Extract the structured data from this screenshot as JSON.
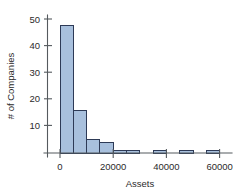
{
  "chart_data": {
    "type": "bar",
    "title": "",
    "subtitle": "",
    "xlabel": "Assets",
    "ylabel": "# of Companies",
    "xlim": [
      -3000,
      67000
    ],
    "ylim": [
      0,
      52
    ],
    "xticks": [
      0,
      20000,
      40000,
      60000
    ],
    "xtick_labels": [
      "0",
      "20000",
      "40000",
      "60000"
    ],
    "yticks": [
      10,
      20,
      30,
      40,
      50
    ],
    "ytick_labels": [
      "10",
      "20",
      "30",
      "40",
      "50"
    ],
    "grid": false,
    "legend": false,
    "bin_width": 5000,
    "bins": [
      {
        "x0": 0,
        "x1": 5000,
        "value": 47.5
      },
      {
        "x0": 5000,
        "x1": 10000,
        "value": 15.8
      },
      {
        "x0": 10000,
        "x1": 15000,
        "value": 5.0
      },
      {
        "x0": 15000,
        "x1": 20000,
        "value": 4.0
      },
      {
        "x0": 20000,
        "x1": 25000,
        "value": 1.0
      },
      {
        "x0": 25000,
        "x1": 30000,
        "value": 1.0
      },
      {
        "x0": 35000,
        "x1": 40000,
        "value": 1.0
      },
      {
        "x0": 45000,
        "x1": 50000,
        "value": 1.0
      },
      {
        "x0": 55000,
        "x1": 60000,
        "value": 1.0
      }
    ],
    "categories": [
      "0-5000",
      "5000-10000",
      "10000-15000",
      "15000-20000",
      "20000-25000",
      "25000-30000",
      "35000-40000",
      "45000-50000",
      "55000-60000"
    ],
    "values": [
      47.5,
      15.8,
      5.0,
      4.0,
      1.0,
      1.0,
      1.0,
      1.0,
      1.0
    ],
    "colors": {
      "bar_fill": "#a8c0dd",
      "bar_stroke": "#2d3a56",
      "axis": "#555a5e",
      "text": "#2b2b2b",
      "background": "#ffffff"
    }
  }
}
